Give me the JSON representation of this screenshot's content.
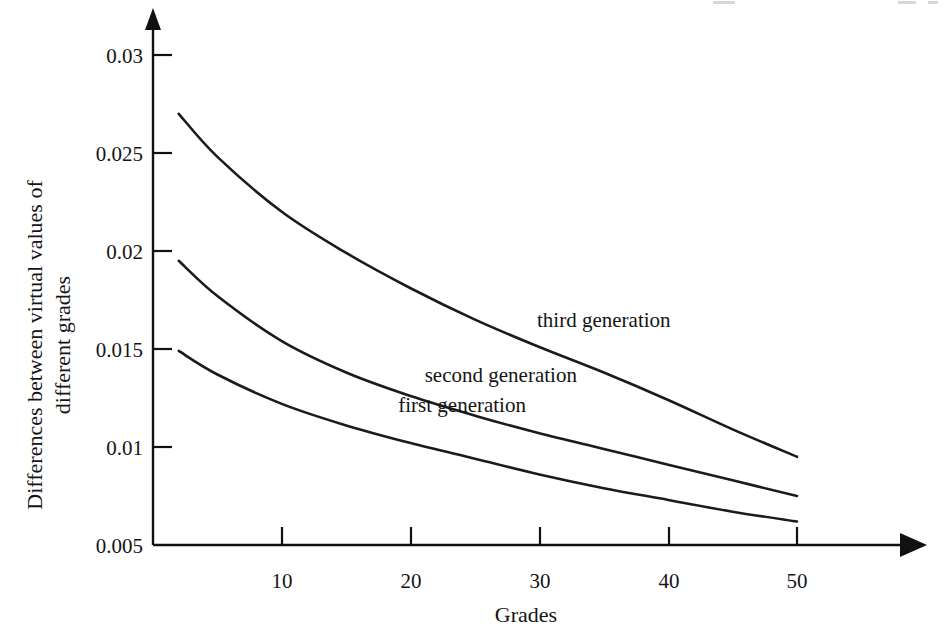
{
  "chart_data": {
    "type": "line",
    "title": "",
    "xlabel": "Grades",
    "ylabel": "Differences between virtual values of different grades",
    "ylabel_line1": "Differences between virtual values of",
    "ylabel_line2": "different grades",
    "xlim": [
      0,
      55
    ],
    "ylim": [
      0.005,
      0.03
    ],
    "xticks": [
      10,
      20,
      30,
      40,
      50
    ],
    "xtick_labels": [
      "10",
      "20",
      "30",
      "40",
      "50"
    ],
    "yticks": [
      0.005,
      0.01,
      0.015,
      0.02,
      0.025,
      0.03
    ],
    "ytick_labels": [
      "0.005",
      "0.01",
      "0.015",
      "0.02",
      "0.025",
      "0.03"
    ],
    "grid": false,
    "legend": "inline-annotations",
    "x": [
      2,
      5,
      10,
      15,
      20,
      25,
      30,
      35,
      40,
      45,
      50
    ],
    "series": [
      {
        "name": "third generation",
        "label": "third generation",
        "values": [
          0.027,
          0.0248,
          0.022,
          0.0199,
          0.0181,
          0.0165,
          0.0151,
          0.0138,
          0.0124,
          0.0109,
          0.0095
        ],
        "label_x": 35,
        "label_y": 0.0161
      },
      {
        "name": "second generation",
        "label": "second generation",
        "values": [
          0.0195,
          0.0177,
          0.0154,
          0.0138,
          0.0126,
          0.0116,
          0.0107,
          0.0099,
          0.0091,
          0.0083,
          0.0075
        ],
        "label_x": 27,
        "label_y": 0.0133
      },
      {
        "name": "first generation",
        "label": "first generation",
        "values": [
          0.0149,
          0.0137,
          0.0122,
          0.0111,
          0.0102,
          0.0094,
          0.0086,
          0.0079,
          0.0073,
          0.0067,
          0.0062
        ],
        "label_x": 24,
        "label_y": 0.0118
      }
    ],
    "colors": {
      "axis": "#111111",
      "curve": "#1b1b1b",
      "background": "#ffffff"
    }
  },
  "axes": {
    "x_axis_name": "grades-axis",
    "y_axis_name": "differences-axis"
  }
}
